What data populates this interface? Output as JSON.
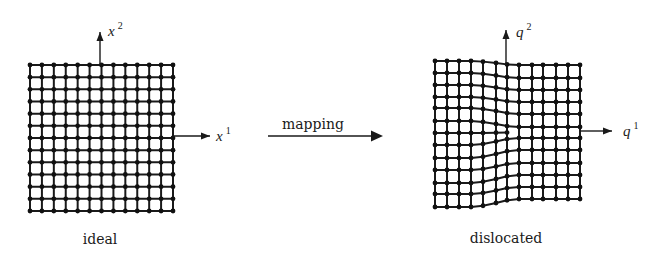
{
  "figure": {
    "ideal": {
      "caption": "ideal",
      "caption_pos": [
        100,
        244
      ],
      "columns": 13,
      "rows": 13,
      "x_range": [
        30,
        173
      ],
      "y_range": [
        65,
        211
      ],
      "axes": {
        "vertical": {
          "label": "x",
          "superscript": "2",
          "from": [
            100,
            65
          ],
          "to": [
            100,
            32
          ],
          "label_pos": [
            108,
            36
          ]
        },
        "horizontal": {
          "label": "x",
          "superscript": "1",
          "from": [
            173,
            136
          ],
          "to": [
            210,
            136
          ],
          "label_pos": [
            216,
            141
          ]
        }
      }
    },
    "mapping": {
      "label": "mapping",
      "label_pos": [
        313,
        129
      ],
      "from": [
        268,
        136
      ],
      "to": [
        383,
        136
      ]
    },
    "dislocated": {
      "caption": "dislocated",
      "caption_pos": [
        506,
        243
      ],
      "column_x": [
        435,
        447,
        459,
        471,
        483,
        496,
        507,
        519,
        532,
        543,
        556,
        568,
        580
      ],
      "left_rows_y": [
        61,
        73,
        85,
        97,
        108,
        121,
        133,
        145,
        158,
        170,
        183,
        194,
        207
      ],
      "right_rows_y": [
        65,
        78,
        90,
        102,
        114,
        127,
        138,
        150,
        163,
        175,
        187,
        199
      ],
      "extra_half_row_index": 6,
      "core_column_index": 6,
      "blend_columns": [
        3,
        7
      ],
      "axes": {
        "vertical": {
          "label": "q",
          "superscript": "2",
          "from": [
            506,
            65
          ],
          "to": [
            506,
            30
          ],
          "label_pos": [
            516,
            37
          ]
        },
        "horizontal": {
          "label": "q",
          "superscript": "1",
          "from": [
            580,
            131
          ],
          "to": [
            612,
            131
          ],
          "label_pos": [
            623,
            136
          ]
        }
      }
    }
  }
}
